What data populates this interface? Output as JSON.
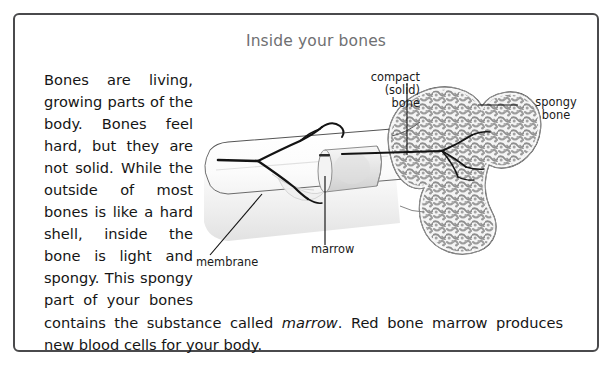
{
  "frame": {
    "border_color": "#4a4a4c"
  },
  "title": {
    "text": "Inside your bones",
    "color": "#6f7072"
  },
  "body": {
    "paragraph_part1": "Bones are living, growing parts of the body. Bones feel hard, but they are not solid. While the outside of most bones is like a hard shell, inside the bone is light and spongy. This spongy part of your bones contains the substance called ",
    "emphasis": "marrow",
    "paragraph_part2": ". Red bone marrow produces new blood cells for your body."
  },
  "diagram": {
    "name": "bone-cross-section-illustration",
    "labels": {
      "compact_bone": "compact\n(solid)\nbone",
      "spongy_bone": "spongy\nbone",
      "membrane": "membrane",
      "marrow": "marrow"
    },
    "colors": {
      "outline": "#3c3c3c",
      "spongy_fill": "#9a9a9a",
      "shaft_fill": "#f2f2f2",
      "vessel": "#1d1d1d",
      "leader": "#111111"
    }
  }
}
